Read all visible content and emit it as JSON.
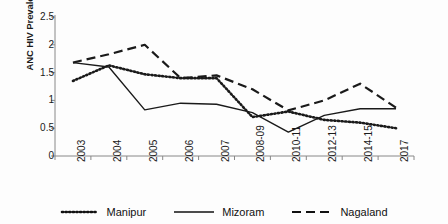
{
  "chart_data": {
    "type": "line",
    "title": "",
    "xlabel": "",
    "ylabel": "ANC HIV Prevalence ()%",
    "categories": [
      "2003",
      "2004",
      "2005",
      "2006",
      "2007",
      "2008-09",
      "2010-11",
      "2012-13",
      "2014-15",
      "2017"
    ],
    "ylim": [
      0,
      2.5
    ],
    "yticks": [
      "0",
      "0.5",
      "1",
      "1.5",
      "2",
      "2.5"
    ],
    "ytick_values": [
      0,
      0.5,
      1,
      1.5,
      2,
      2.5
    ],
    "grid": false,
    "legend_position": "bottom",
    "series": [
      {
        "name": "Manipur",
        "style": "dotted",
        "color": "#1a1a1a",
        "values": [
          1.35,
          1.63,
          1.47,
          1.4,
          1.4,
          0.7,
          0.8,
          0.65,
          0.6,
          0.5
        ]
      },
      {
        "name": "Mizoram",
        "style": "solid",
        "color": "#1a1a1a",
        "values": [
          1.68,
          1.6,
          0.83,
          0.95,
          0.93,
          0.78,
          0.43,
          0.73,
          0.85,
          0.85
        ]
      },
      {
        "name": "Nagaland",
        "style": "dashed",
        "color": "#1a1a1a",
        "values": [
          1.68,
          1.83,
          2.0,
          1.4,
          1.45,
          1.2,
          0.82,
          1.0,
          1.3,
          0.87
        ]
      }
    ]
  },
  "legend": {
    "items": [
      {
        "label": "Manipur",
        "style": "dotted"
      },
      {
        "label": "Mizoram",
        "style": "solid"
      },
      {
        "label": "Nagaland",
        "style": "dashed"
      }
    ]
  },
  "axis": {
    "y_title": "ANC HIV Prevalence ()%"
  }
}
